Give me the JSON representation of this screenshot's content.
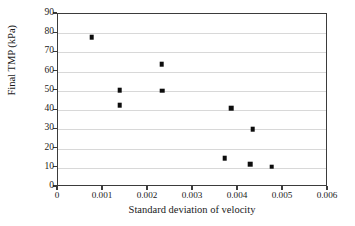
{
  "chart_data": {
    "type": "scatter",
    "title": "",
    "xlabel": "Standard deviation of velocity",
    "ylabel": "Final TMP (kPa)",
    "xlim": [
      0,
      0.006
    ],
    "ylim": [
      0,
      90
    ],
    "xticks": [
      0,
      0.001,
      0.002,
      0.003,
      0.004,
      0.005,
      0.006
    ],
    "xtick_labels": [
      "0",
      "0.001",
      "0.002",
      "0.003",
      "0.004",
      "0.005",
      "0.006"
    ],
    "yticks": [
      0,
      10,
      20,
      30,
      40,
      50,
      60,
      70,
      80,
      90
    ],
    "ytick_labels": [
      "0",
      "10",
      "20",
      "30",
      "40",
      "50",
      "60",
      "70",
      "80",
      "90"
    ],
    "grid": "horizontal",
    "legend": "none",
    "marker": "square",
    "marker_color": "#0d0d0d",
    "series": [
      {
        "name": "Final TMP vs standard deviation of velocity",
        "points": [
          {
            "x": 0.00075,
            "y": 78.0
          },
          {
            "x": 0.00137,
            "y": 50.5
          },
          {
            "x": 0.00137,
            "y": 42.5
          },
          {
            "x": 0.0023,
            "y": 64.0
          },
          {
            "x": 0.00231,
            "y": 50.0
          },
          {
            "x": 0.0037,
            "y": 15.0
          },
          {
            "x": 0.00385,
            "y": 41.0
          },
          {
            "x": 0.00427,
            "y": 12.0
          },
          {
            "x": 0.00433,
            "y": 30.0
          },
          {
            "x": 0.00475,
            "y": 10.5
          }
        ]
      }
    ]
  }
}
